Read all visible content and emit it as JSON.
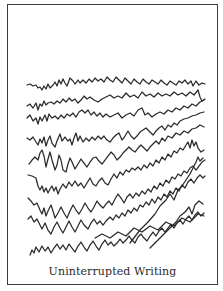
{
  "figure": {
    "caption": "Uninterrupted Writing",
    "line_count": 9,
    "stroke_color": "#2a2a2a",
    "border_color": "#3a3a3a",
    "background_color": "#ffffff"
  }
}
